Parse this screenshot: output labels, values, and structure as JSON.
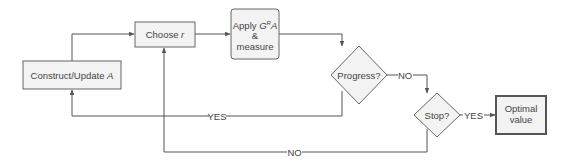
{
  "diagram": {
    "type": "flowchart",
    "colors": {
      "line": "#555555",
      "box_fill": "#f3f3f3",
      "box_stroke": "#666666",
      "text": "#444444"
    },
    "nodes": {
      "construct": {
        "label": "Construct/Update ",
        "var": "A",
        "shape": "rect"
      },
      "choose": {
        "label": "Choose ",
        "var": "r",
        "shape": "rect"
      },
      "apply": {
        "line1_prefix": "Apply ",
        "G": "G",
        "sup": "R",
        "A": "A",
        "line2": "&",
        "line3": "measure",
        "shape": "rounded-rect"
      },
      "progress": {
        "label": "Progress?",
        "shape": "diamond"
      },
      "stop": {
        "label": "Stop?",
        "shape": "diamond"
      },
      "optimal": {
        "line1": "Optimal",
        "line2": "value",
        "shape": "rect-thick"
      }
    },
    "edges": [
      {
        "from": "construct",
        "to": "choose",
        "label": ""
      },
      {
        "from": "choose",
        "to": "apply",
        "label": ""
      },
      {
        "from": "apply",
        "to": "progress",
        "label": ""
      },
      {
        "from": "progress",
        "to": "stop",
        "label": "NO"
      },
      {
        "from": "progress",
        "to": "construct",
        "label": "YES"
      },
      {
        "from": "stop",
        "to": "optimal",
        "label": "YES"
      },
      {
        "from": "stop",
        "to": "choose",
        "label": "NO"
      }
    ],
    "edge_labels": {
      "progress_no": "NO",
      "progress_yes": "YES",
      "stop_yes": "YES",
      "stop_no": "NO"
    }
  }
}
